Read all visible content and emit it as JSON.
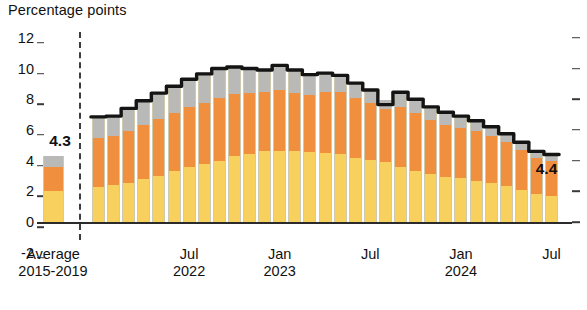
{
  "chart_data": {
    "type": "bar",
    "title": "Percentage points",
    "xlabel": "",
    "ylabel": "Percentage points",
    "ylim": [
      -2,
      12
    ],
    "ytick_labels": [
      "12",
      "10",
      "8",
      "6",
      "4",
      "2",
      "0",
      "-2"
    ],
    "ytick_values": [
      12,
      10,
      8,
      6,
      4,
      2,
      0,
      -2
    ],
    "grid": false,
    "legend_position": "none",
    "stacked": true,
    "series": [
      {
        "name": "lower-segment",
        "color": "#F8D05E",
        "values": [
          2.0,
          2.3,
          2.4,
          2.55,
          2.8,
          3.0,
          3.3,
          3.55,
          3.75,
          3.95,
          4.3,
          4.45,
          4.6,
          4.65,
          4.6,
          4.55,
          4.5,
          4.4,
          4.2,
          4.05,
          3.9,
          3.6,
          3.35,
          3.1,
          2.95,
          2.85,
          2.7,
          2.55,
          2.35,
          2.1,
          1.8,
          1.7
        ]
      },
      {
        "name": "middle-segment",
        "color": "#F0903E",
        "values": [
          1.6,
          3.2,
          3.2,
          3.4,
          3.55,
          3.7,
          3.8,
          3.95,
          4.0,
          4.1,
          4.05,
          3.95,
          3.85,
          3.95,
          3.8,
          3.7,
          3.95,
          4.05,
          3.9,
          3.7,
          3.45,
          3.9,
          3.75,
          3.55,
          3.4,
          3.3,
          3.2,
          3.05,
          2.85,
          2.6,
          2.4,
          2.3
        ]
      },
      {
        "name": "upper-segment",
        "color": "#B9B9B7",
        "values": [
          0.7,
          1.35,
          1.3,
          1.45,
          1.55,
          1.7,
          1.75,
          1.8,
          1.9,
          1.95,
          1.75,
          1.6,
          1.45,
          1.6,
          1.5,
          1.35,
          1.25,
          1.1,
          0.95,
          0.85,
          0.6,
          0.95,
          0.9,
          0.85,
          0.8,
          0.75,
          0.7,
          0.6,
          0.55,
          0.5,
          0.4,
          0.4
        ]
      }
    ],
    "totals": [
      4.3,
      6.85,
      6.9,
      7.4,
      7.9,
      8.4,
      8.85,
      9.3,
      9.65,
      10.0,
      10.1,
      10.0,
      9.9,
      10.2,
      9.9,
      9.6,
      9.7,
      9.55,
      9.05,
      8.6,
      7.65,
      8.45,
      8.0,
      7.5,
      7.15,
      6.9,
      6.6,
      6.2,
      5.75,
      5.2,
      4.6,
      4.4
    ],
    "x_tick_positions": [
      {
        "label_top": "Average",
        "label_bottom": "2015-2019",
        "index": 0
      },
      {
        "label_top": "Jul",
        "label_bottom": "2022",
        "index": 7
      },
      {
        "label_top": "Jan",
        "label_bottom": "2023",
        "index": 13
      },
      {
        "label_top": "Jul",
        "label_bottom": "",
        "index": 19
      },
      {
        "label_top": "Jan",
        "label_bottom": "2024",
        "index": 25
      },
      {
        "label_top": "Jul",
        "label_bottom": "",
        "index": 31
      }
    ],
    "annotations": [
      {
        "name": "average-value-label",
        "text": "4.3",
        "index": 0,
        "value": 4.3
      },
      {
        "name": "latest-value-label",
        "text": "4.4",
        "index": 31,
        "value": 4.4
      }
    ],
    "topline": {
      "name": "total-line",
      "color": "#141414",
      "width": 3.4
    }
  },
  "colors": {
    "low": "#F8D05E",
    "mid": "#F0903E",
    "top": "#B9B9B7",
    "line": "#141414",
    "axis": "#2b2b2b",
    "text": "#111111"
  }
}
